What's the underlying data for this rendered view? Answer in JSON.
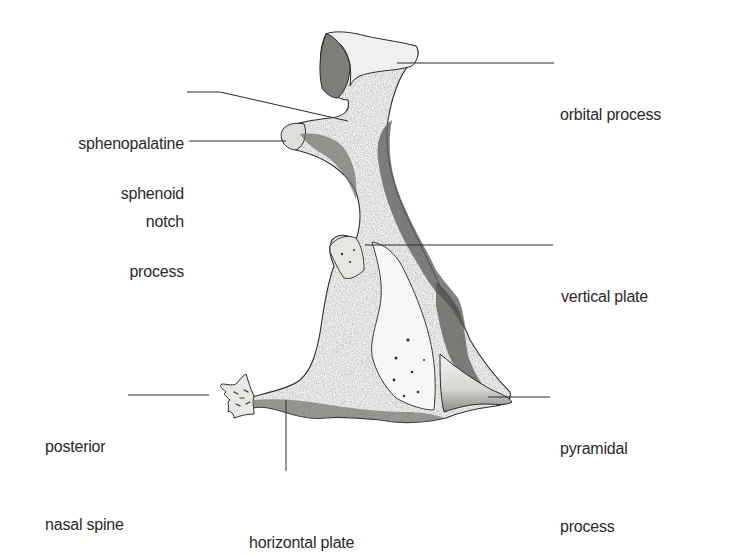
{
  "diagram": {
    "colors": {
      "ink": "#2a2a2a",
      "bone_light": "#f4f4f2",
      "bone_mid": "#cfcfcc",
      "bone_dark": "#6e6e6b",
      "background": "#ffffff"
    },
    "labels": [
      {
        "id": "sphenopalatine-notch",
        "lines": [
          "sphenopalatine",
          "notch"
        ],
        "side": "left"
      },
      {
        "id": "sphenoid-process",
        "lines": [
          "sphenoid",
          "process"
        ],
        "side": "left"
      },
      {
        "id": "posterior-nasal-spine",
        "lines": [
          "posterior",
          "nasal spine"
        ],
        "side": "left"
      },
      {
        "id": "orbital-process",
        "lines": [
          "orbital process"
        ],
        "side": "right"
      },
      {
        "id": "vertical-plate",
        "lines": [
          "vertical plate"
        ],
        "side": "right"
      },
      {
        "id": "pyramidal-process",
        "lines": [
          "pyramidal",
          "process"
        ],
        "side": "right"
      },
      {
        "id": "horizontal-plate",
        "lines": [
          "horizontal plate"
        ],
        "side": "bottom"
      }
    ]
  }
}
